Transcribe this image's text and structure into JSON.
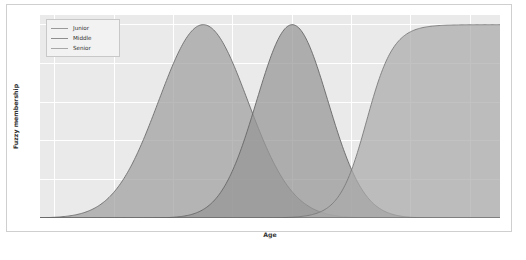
{
  "chart_data": {
    "type": "area",
    "title": "",
    "xlabel": "Age",
    "ylabel": "Fuzzy membership",
    "xlim": [
      -0.5,
      15.0
    ],
    "ylim": [
      0.0,
      1.05
    ],
    "xticks": [
      "0",
      "2",
      "4",
      "6",
      "8",
      "10",
      "12",
      "14"
    ],
    "xtick_values": [
      0,
      2,
      4,
      6,
      8,
      10,
      12,
      14
    ],
    "yticks": [
      "0.0",
      "0.2",
      "0.4",
      "0.6",
      "0.8",
      "1.0"
    ],
    "ytick_values": [
      0.0,
      0.2,
      0.4,
      0.6,
      0.8,
      1.0
    ],
    "grid": true,
    "legend_position": "upper left",
    "series": [
      {
        "name": "Junior",
        "shape": "gaussian",
        "center": 5.0,
        "sigma": 1.5,
        "peak": 1.0,
        "color": "#9a9a9a",
        "fill_color": "#9f9f9f",
        "line_color": "#6d6d6d",
        "x": [
          0,
          1,
          2,
          3,
          4,
          5,
          6,
          7,
          8,
          9,
          10,
          11,
          12,
          13,
          14,
          15
        ],
        "values": [
          0.004,
          0.027,
          0.135,
          0.411,
          0.801,
          1.0,
          0.801,
          0.411,
          0.135,
          0.027,
          0.004,
          0.0,
          0.0,
          0.0,
          0.0,
          0.0
        ]
      },
      {
        "name": "Middle",
        "shape": "gaussian",
        "center": 8.0,
        "sigma": 1.2,
        "peak": 1.0,
        "color": "#8f8f8f",
        "fill_color": "#959595",
        "line_color": "#666666",
        "x": [
          0,
          1,
          2,
          3,
          4,
          5,
          6,
          7,
          8,
          9,
          10,
          11,
          12,
          13,
          14,
          15
        ],
        "values": [
          0.0,
          0.0,
          0.0,
          0.001,
          0.039,
          0.249,
          0.707,
          0.971,
          1.0,
          0.971,
          0.707,
          0.249,
          0.039,
          0.001,
          0.0,
          0.0
        ]
      },
      {
        "name": "Senior",
        "shape": "sigmoid",
        "center": 10.5,
        "slope": 2.2,
        "peak": 1.0,
        "color": "#a8a8a8",
        "fill_color": "#ababab",
        "line_color": "#7a7a7a",
        "x": [
          0,
          1,
          2,
          3,
          4,
          5,
          6,
          7,
          8,
          9,
          10,
          11,
          12,
          13,
          14,
          15
        ],
        "values": [
          0.0,
          0.0,
          0.0,
          0.0,
          0.0,
          0.0,
          0.0,
          0.003,
          0.03,
          0.21,
          0.67,
          0.95,
          1.0,
          1.0,
          1.0,
          1.0
        ]
      }
    ]
  },
  "legend": {
    "entries": [
      {
        "label": "Junior"
      },
      {
        "label": "Middle"
      },
      {
        "label": "Senior"
      }
    ]
  },
  "colors": {
    "plot_background": "#eaeaea",
    "figure_background": "#ffffff",
    "grid": "#ffffff",
    "tick_label": "#555555",
    "axis_label": "#333333",
    "baseline": "#5a5a5a"
  }
}
